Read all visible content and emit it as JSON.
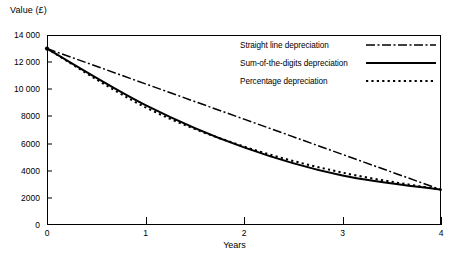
{
  "chart_data": {
    "type": "line",
    "title": "",
    "xlabel": "Years",
    "ylabel": "Value (£)",
    "xlim": [
      0,
      4
    ],
    "ylim": [
      0,
      14000
    ],
    "grid": false,
    "legend_position": "upper right inside plot",
    "x": [
      0,
      1,
      2,
      3,
      4
    ],
    "xtick_labels": [
      "0",
      "1",
      "2",
      "3",
      "4"
    ],
    "ytick_values": [
      0,
      2000,
      4000,
      6000,
      8000,
      10000,
      12000,
      14000
    ],
    "ytick_labels": [
      "0",
      "2000",
      "4000",
      "6000",
      "8000",
      "10 000",
      "12 000",
      "14 000"
    ],
    "series": [
      {
        "name": "Straight line depreciation",
        "style": "dash-dot",
        "values": [
          13000,
          10400,
          7800,
          5200,
          2600
        ]
      },
      {
        "name": "Sum-of-the-digits depreciation",
        "style": "solid",
        "values": [
          13000,
          8840,
          5720,
          3640,
          2600
        ]
      },
      {
        "name": "Percentage depreciation",
        "style": "dotted",
        "values": [
          13000,
          8670,
          5780,
          3860,
          2600
        ]
      }
    ]
  },
  "axes": {
    "y_title": "Value (£)",
    "x_title": "Years",
    "y_ticks": [
      {
        "label": "14 000",
        "value": 14000
      },
      {
        "label": "12 000",
        "value": 12000
      },
      {
        "label": "10 000",
        "value": 10000
      },
      {
        "label": "8000",
        "value": 8000
      },
      {
        "label": "6000",
        "value": 6000
      },
      {
        "label": "4000",
        "value": 4000
      },
      {
        "label": "2000",
        "value": 2000
      },
      {
        "label": "0",
        "value": 0
      }
    ],
    "x_ticks": [
      {
        "label": "0",
        "value": 0
      },
      {
        "label": "1",
        "value": 1
      },
      {
        "label": "2",
        "value": 2
      },
      {
        "label": "3",
        "value": 3
      },
      {
        "label": "4",
        "value": 4
      }
    ]
  },
  "legend": {
    "items": [
      {
        "label": "Straight line depreciation",
        "style": "dash-dot"
      },
      {
        "label": "Sum-of-the-digits depreciation",
        "style": "solid"
      },
      {
        "label": "Percentage depreciation",
        "style": "dotted"
      }
    ]
  },
  "colors": {
    "line": "#000000",
    "frame": "#000000",
    "background": "#ffffff",
    "text": "#000000"
  }
}
